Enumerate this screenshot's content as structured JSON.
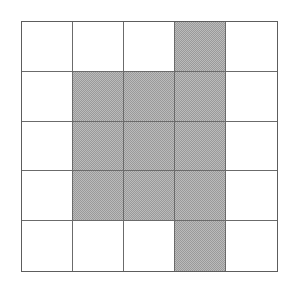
{
  "figure": {
    "type": "grid-shading-diagram",
    "rows": 5,
    "columns": 5,
    "cell_size_px": 50,
    "colors": {
      "shaded_fill": "#9a9a9a",
      "empty_fill": "#ffffff",
      "grid_line": "#6b6b6b",
      "outer_border": "#5d5d5d",
      "background": "#ffffff"
    },
    "grid": [
      [
        0,
        0,
        0,
        1,
        0
      ],
      [
        0,
        1,
        1,
        1,
        0
      ],
      [
        0,
        1,
        1,
        1,
        0
      ],
      [
        0,
        1,
        1,
        1,
        0
      ],
      [
        0,
        0,
        0,
        1,
        0
      ]
    ],
    "shaded_count": 13,
    "empty_count": 12,
    "cell_labels": [
      [
        "",
        "",
        "",
        "",
        ""
      ],
      [
        "",
        "",
        "",
        "",
        ""
      ],
      [
        "",
        "",
        "",
        "",
        ""
      ],
      [
        "",
        "",
        "",
        "",
        ""
      ],
      [
        "",
        "",
        "",
        "",
        ""
      ]
    ]
  }
}
